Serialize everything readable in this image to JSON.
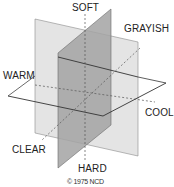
{
  "diagram": {
    "type": "three-intersecting-planes",
    "axes": {
      "vertical": {
        "top": "SOFT",
        "bottom": "HARD"
      },
      "diagonal": {
        "back": "GRAYISH",
        "front": "CLEAR"
      },
      "horizontal": {
        "left": "WARM",
        "right": "COOL"
      }
    },
    "labels": {
      "soft": "SOFT",
      "grayish": "GRAYISH",
      "warm": "WARM",
      "cool": "COOL",
      "clear": "CLEAR",
      "hard": "HARD"
    },
    "copyright": "© 1975 NCD",
    "colors": {
      "light_plane": "#e2e2e2",
      "dark_plane": "#9a9a9a",
      "outline": "#555555",
      "dashed": "#666666"
    }
  }
}
